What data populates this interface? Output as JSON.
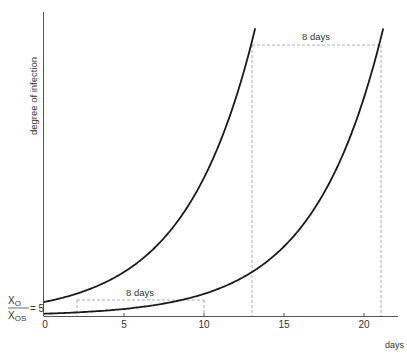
{
  "chart_data": {
    "type": "line",
    "title": "",
    "xlabel": "days",
    "ylabel": "degree of infection",
    "xlim": [
      0,
      23
    ],
    "x_ticks": [
      0,
      5,
      10,
      15,
      20
    ],
    "x_tick_labels": [
      "0",
      "5",
      "10",
      "15",
      "20"
    ],
    "y_ticks": [],
    "grid": false,
    "legend": null,
    "series": [
      {
        "name": "infection curve (x0 = 5 at day 0)",
        "growth_rate_per_day": 0.229,
        "x": [
          0,
          2,
          4,
          6,
          8,
          10,
          12,
          13,
          13.2
        ],
        "values": [
          5,
          7.9,
          12.5,
          19.7,
          31.2,
          49.3,
          77.9,
          97.9,
          102.6
        ]
      },
      {
        "name": "infection curve (shifted 8 days)",
        "growth_rate_per_day": 0.229,
        "x": [
          0,
          2,
          4,
          6,
          8,
          10,
          12,
          14,
          16,
          18,
          20,
          21,
          21.2
        ],
        "values": [
          0.8,
          1.3,
          2.0,
          3.2,
          5,
          7.9,
          12.5,
          19.7,
          31.2,
          49.3,
          77.9,
          97.9,
          102.6
        ]
      }
    ],
    "annotations": [
      {
        "text": "8 days",
        "type": "horizontal-dashed-span",
        "from_x": 2,
        "to_x": 10,
        "y": 7.9
      },
      {
        "text": "8 days",
        "type": "horizontal-dashed-span",
        "from_x": 13,
        "to_x": 21,
        "y": 97.9
      },
      {
        "text": "X_O / X_OS = 5",
        "type": "y-axis-label",
        "y": 5
      }
    ],
    "dashed_verticals_x": [
      2,
      10,
      13,
      21
    ]
  },
  "labels": {
    "ylabel": "degree of infection",
    "xlabel": "days",
    "ratio_num": "X",
    "ratio_num_sub": "O",
    "ratio_den": "X",
    "ratio_den_sub": "OS",
    "ratio_value": "= 5",
    "span_low": "8 days",
    "span_high": "8 days",
    "tick0": "0",
    "tick5": "5",
    "tick10": "10",
    "tick15": "15",
    "tick20": "20"
  },
  "colors": {
    "curve": "#1a1a1a",
    "axis": "#444444",
    "dashed": "#999999",
    "text": "#333333"
  }
}
